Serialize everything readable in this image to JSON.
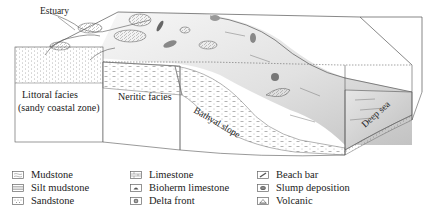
{
  "diagram": {
    "labels": {
      "estuary": "Estuary",
      "littoral_line1": "Littoral facies",
      "littoral_line2": "(sandy coastal zone)",
      "neritic": "Neritic facies",
      "bathyal": "Bathyal slope",
      "deep_sea": "Deep sea"
    }
  },
  "legend": {
    "columns": [
      {
        "items": [
          {
            "icon": "mudstone-icon",
            "label": "Mudstone"
          },
          {
            "icon": "silt-mudstone-icon",
            "label": "Silt mudstone"
          },
          {
            "icon": "sandstone-icon",
            "label": "Sandstone"
          }
        ]
      },
      {
        "items": [
          {
            "icon": "limestone-icon",
            "label": "Limestone"
          },
          {
            "icon": "bioherm-limestone-icon",
            "label": "Bioherm limestone"
          },
          {
            "icon": "delta-front-icon",
            "label": "Delta front"
          }
        ]
      },
      {
        "items": [
          {
            "icon": "beach-bar-icon",
            "label": "Beach bar"
          },
          {
            "icon": "slump-deposition-icon",
            "label": "Slump deposition"
          },
          {
            "icon": "volcanic-icon",
            "label": "Volcanic"
          }
        ]
      }
    ]
  },
  "colors": {
    "line": "#555555",
    "sea_dark": "#b9b9b9",
    "sea_light": "#f2f2f2"
  }
}
